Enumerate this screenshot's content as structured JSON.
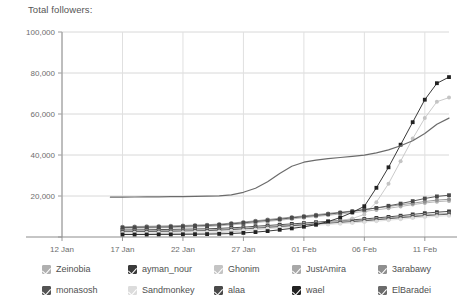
{
  "title": "Total followers:",
  "chart_data": {
    "type": "line",
    "title": "Total followers:",
    "xlabel": "",
    "ylabel": "",
    "ylim": [
      0,
      100000
    ],
    "yticks": [
      0,
      20000,
      40000,
      60000,
      80000,
      100000
    ],
    "ytick_labels": [
      "",
      "20,000",
      "40,000",
      "60,000",
      "80,000",
      "100,000"
    ],
    "grid": true,
    "legend_position": "bottom",
    "x": [
      "12 Jan",
      "13 Jan",
      "14 Jan",
      "15 Jan",
      "16 Jan",
      "17 Jan",
      "18 Jan",
      "19 Jan",
      "20 Jan",
      "21 Jan",
      "22 Jan",
      "23 Jan",
      "24 Jan",
      "25 Jan",
      "26 Jan",
      "27 Jan",
      "28 Jan",
      "29 Jan",
      "30 Jan",
      "31 Jan",
      "01 Feb",
      "02 Feb",
      "03 Feb",
      "04 Feb",
      "05 Feb",
      "06 Feb",
      "07 Feb",
      "08 Feb",
      "09 Feb",
      "10 Feb",
      "11 Feb",
      "12 Feb",
      "13 Feb"
    ],
    "xtick_labels": [
      "12 Jan",
      "17 Jan",
      "22 Jan",
      "27 Jan",
      "01 Feb",
      "06 Feb",
      "11 Feb"
    ],
    "xtick_indices": [
      0,
      5,
      10,
      15,
      20,
      25,
      30
    ],
    "series": [
      {
        "name": "Zeinobia",
        "color": "#b0b0b0",
        "marker": "circle",
        "values": [
          null,
          null,
          null,
          null,
          null,
          4200,
          4300,
          4400,
          4500,
          4650,
          4800,
          4950,
          5100,
          5400,
          5900,
          6400,
          7000,
          7600,
          8200,
          8800,
          9400,
          10000,
          10600,
          11200,
          11800,
          12500,
          13200,
          14000,
          14900,
          15800,
          16600,
          17200,
          17600
        ]
      },
      {
        "name": "ayman_nour",
        "color": "#3a3a3a",
        "marker": "square",
        "values": [
          null,
          null,
          null,
          null,
          null,
          3400,
          3450,
          3500,
          3600,
          3700,
          3800,
          3900,
          4000,
          4200,
          4500,
          4800,
          5200,
          5600,
          6000,
          6400,
          6800,
          7200,
          7600,
          8000,
          8400,
          8800,
          9300,
          9800,
          10400,
          11000,
          11600,
          12100,
          12500
        ]
      },
      {
        "name": "Ghonim",
        "color": "#c4c4c4",
        "marker": "circle",
        "values": [
          null,
          null,
          null,
          null,
          null,
          1500,
          1520,
          1550,
          1600,
          1650,
          1700,
          1800,
          1900,
          2100,
          2500,
          3000,
          3600,
          4200,
          4800,
          5400,
          6000,
          6600,
          7200,
          8000,
          9000,
          11000,
          17000,
          26000,
          37000,
          48000,
          58000,
          66000,
          68000
        ]
      },
      {
        "name": "JustAmira",
        "color": "#a8a8a8",
        "marker": "circle",
        "values": [
          null,
          null,
          null,
          null,
          null,
          3000,
          3050,
          3100,
          3150,
          3200,
          3300,
          3400,
          3500,
          3700,
          4000,
          4300,
          4700,
          5100,
          5500,
          5900,
          6300,
          6700,
          7100,
          7500,
          7900,
          8300,
          8800,
          9300,
          9800,
          10300,
          10800,
          11200,
          11500
        ]
      },
      {
        "name": "3arabawy",
        "color": "#8f8f8f",
        "marker": "circle",
        "values": [
          null,
          null,
          null,
          null,
          null,
          5000,
          5100,
          5200,
          5300,
          5450,
          5600,
          5800,
          6000,
          6300,
          6800,
          7300,
          7900,
          8500,
          9100,
          9700,
          10300,
          10900,
          11500,
          12100,
          12700,
          13400,
          14100,
          14900,
          15700,
          16500,
          17300,
          18000,
          18400
        ]
      },
      {
        "name": "monasosh",
        "color": "#545454",
        "marker": "square",
        "values": [
          null,
          null,
          null,
          null,
          null,
          2600,
          2650,
          2700,
          2750,
          2800,
          2900,
          3000,
          3100,
          3300,
          3600,
          3900,
          4300,
          4700,
          5100,
          5500,
          5900,
          6300,
          6700,
          7100,
          7500,
          7900,
          8400,
          8900,
          9400,
          9900,
          10400,
          10800,
          11100
        ]
      },
      {
        "name": "Sandmonkey",
        "color": "#dcdcdc",
        "marker": "circle",
        "values": [
          null,
          null,
          null,
          null,
          null,
          2000,
          2050,
          2100,
          2150,
          2200,
          2300,
          2400,
          2500,
          2700,
          3000,
          3300,
          3700,
          4100,
          4500,
          4900,
          5300,
          5700,
          6100,
          6500,
          6900,
          7300,
          7700,
          8200,
          8700,
          9200,
          9700,
          10100,
          10400
        ]
      },
      {
        "name": "alaa",
        "color": "#4a4a4a",
        "marker": "square",
        "values": [
          null,
          null,
          null,
          null,
          null,
          4600,
          4700,
          4800,
          4900,
          5000,
          5200,
          5400,
          5600,
          5900,
          6400,
          6900,
          7500,
          8100,
          8700,
          9300,
          9900,
          10500,
          11100,
          11800,
          12500,
          13300,
          14200,
          15200,
          16300,
          17500,
          18800,
          19800,
          20400
        ]
      },
      {
        "name": "wael",
        "color": "#222222",
        "marker": "square",
        "values": [
          null,
          null,
          null,
          null,
          null,
          1200,
          1220,
          1240,
          1260,
          1280,
          1300,
          1350,
          1400,
          1500,
          1700,
          2000,
          2400,
          2900,
          3500,
          4200,
          5000,
          6000,
          7500,
          9500,
          12000,
          15000,
          24000,
          34000,
          45000,
          56000,
          67000,
          75000,
          78000
        ]
      },
      {
        "name": "ElBaradei",
        "color": "#6b6b6b",
        "marker": "none",
        "values": [
          null,
          null,
          null,
          null,
          19400,
          19450,
          19500,
          19550,
          19600,
          19650,
          19700,
          19800,
          19900,
          20100,
          20600,
          21800,
          23800,
          27000,
          31000,
          34500,
          36500,
          37500,
          38200,
          38800,
          39300,
          39900,
          41000,
          42500,
          44500,
          47000,
          50500,
          55000,
          58000
        ]
      }
    ]
  },
  "legend": {
    "rows": [
      [
        {
          "label": "Zeinobia",
          "checked": true,
          "color": "#b0b0b0"
        },
        {
          "label": "ayman_nour",
          "checked": true,
          "color": "#3a3a3a"
        },
        {
          "label": "Ghonim",
          "checked": true,
          "color": "#c4c4c4"
        },
        {
          "label": "JustAmira",
          "checked": true,
          "color": "#a8a8a8"
        },
        {
          "label": "3arabawy",
          "checked": true,
          "color": "#8f8f8f"
        }
      ],
      [
        {
          "label": "monasosh",
          "checked": true,
          "color": "#545454"
        },
        {
          "label": "Sandmonkey",
          "checked": true,
          "color": "#dcdcdc"
        },
        {
          "label": "alaa",
          "checked": true,
          "color": "#4a4a4a"
        },
        {
          "label": "wael",
          "checked": true,
          "color": "#222222"
        },
        {
          "label": "ElBaradei",
          "checked": true,
          "color": "#6b6b6b"
        }
      ]
    ]
  }
}
